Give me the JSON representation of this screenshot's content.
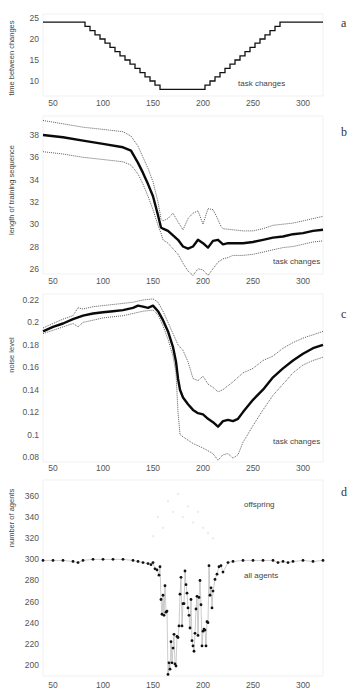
{
  "figure": {
    "panels": [
      {
        "id": "a",
        "label": "a",
        "ylabel": "time between changes",
        "annotation": "task changes"
      },
      {
        "id": "b",
        "label": "b",
        "ylabel": "length of training sequence",
        "annotation": "task changes"
      },
      {
        "id": "c",
        "label": "c",
        "ylabel": "noise level",
        "annotation": "task changes"
      },
      {
        "id": "d",
        "label": "d",
        "ylabel": "number of agents",
        "annotation_top": "offspring",
        "annotation_bottom": "all agents"
      }
    ]
  },
  "chart_data": [
    {
      "panel": "a",
      "type": "line",
      "title": "",
      "xlabel": "",
      "ylabel": "time between changes",
      "xlim": [
        40,
        320
      ],
      "ylim": [
        5,
        25
      ],
      "xticks": [
        50,
        100,
        150,
        200,
        250,
        300
      ],
      "yticks": [
        10,
        15,
        20,
        25
      ],
      "annotations": [
        "task changes"
      ],
      "series": [
        {
          "name": "time between changes",
          "style": "step-solid",
          "x": [
            40,
            80,
            82,
            85,
            87,
            90,
            92,
            95,
            97,
            100,
            102,
            105,
            107,
            110,
            112,
            115,
            117,
            120,
            122,
            125,
            127,
            130,
            132,
            135,
            137,
            140,
            142,
            145,
            147,
            150,
            152,
            155,
            157,
            200,
            202,
            205,
            207,
            210,
            212,
            215,
            217,
            220,
            222,
            225,
            227,
            230,
            232,
            235,
            237,
            240,
            242,
            245,
            247,
            250,
            252,
            255,
            257,
            260,
            262,
            265,
            267,
            270,
            272,
            275,
            277,
            320
          ],
          "y": [
            24,
            24,
            23,
            23,
            22,
            22,
            21,
            21,
            20,
            20,
            19,
            19,
            18,
            18,
            17,
            17,
            16,
            16,
            15,
            15,
            14,
            14,
            13,
            13,
            12,
            12,
            11,
            11,
            10,
            10,
            9,
            9,
            8,
            8,
            9,
            9,
            10,
            10,
            11,
            11,
            12,
            12,
            13,
            13,
            14,
            14,
            15,
            15,
            16,
            16,
            17,
            17,
            18,
            18,
            19,
            19,
            20,
            20,
            21,
            21,
            22,
            22,
            23,
            23,
            24,
            24
          ]
        }
      ]
    },
    {
      "panel": "b",
      "type": "line",
      "ylabel": "length of training sequence",
      "xlim": [
        40,
        320
      ],
      "ylim": [
        25,
        39.5
      ],
      "xticks": [
        50,
        100,
        150,
        200,
        250,
        300
      ],
      "yticks": [
        26,
        28,
        30,
        32,
        34,
        36,
        38
      ],
      "annotations": [
        "task changes"
      ],
      "series": [
        {
          "name": "mean",
          "style": "thick-solid",
          "x": [
            40,
            60,
            80,
            100,
            120,
            128,
            135,
            140,
            145,
            150,
            155,
            158,
            160,
            165,
            170,
            175,
            180,
            185,
            190,
            195,
            200,
            205,
            210,
            215,
            220,
            225,
            230,
            240,
            250,
            260,
            270,
            280,
            290,
            300,
            310,
            320
          ],
          "y": [
            38.0,
            37.8,
            37.5,
            37.2,
            36.9,
            36.6,
            35.5,
            34.6,
            33.6,
            32.5,
            30.8,
            29.7,
            29.6,
            29.4,
            29.0,
            28.6,
            28.0,
            27.8,
            28.0,
            28.6,
            28.3,
            27.9,
            28.5,
            28.6,
            28.2,
            28.3,
            28.3,
            28.3,
            28.4,
            28.6,
            28.8,
            28.9,
            29.1,
            29.2,
            29.4,
            29.5
          ]
        },
        {
          "name": "upper bound",
          "style": "dotted",
          "x": [
            40,
            60,
            80,
            100,
            120,
            128,
            135,
            140,
            145,
            150,
            155,
            158,
            160,
            165,
            170,
            175,
            180,
            185,
            190,
            195,
            200,
            205,
            210,
            213,
            218,
            220,
            230,
            240,
            250,
            260,
            270,
            280,
            290,
            300,
            310,
            320
          ],
          "y": [
            39.3,
            39.0,
            38.7,
            38.5,
            38.3,
            37.9,
            37.0,
            36.0,
            35.0,
            33.8,
            32.0,
            30.5,
            30.3,
            30.5,
            31.0,
            30.2,
            29.5,
            30.5,
            31.0,
            31.2,
            30.0,
            31.4,
            31.3,
            30.8,
            29.8,
            29.6,
            29.5,
            29.4,
            29.4,
            29.6,
            29.9,
            30.0,
            30.1,
            30.3,
            30.5,
            30.7
          ]
        },
        {
          "name": "lower bound",
          "style": "dotted",
          "x": [
            40,
            60,
            80,
            100,
            120,
            128,
            135,
            140,
            145,
            150,
            155,
            158,
            160,
            165,
            170,
            175,
            180,
            185,
            190,
            195,
            200,
            205,
            210,
            215,
            220,
            225,
            230,
            240,
            250,
            260,
            270,
            280,
            290,
            300,
            310,
            320
          ],
          "y": [
            36.5,
            36.3,
            36.0,
            35.8,
            35.6,
            35.3,
            34.5,
            33.6,
            32.5,
            31.3,
            29.9,
            29.2,
            28.6,
            28.3,
            27.8,
            27.3,
            26.5,
            25.8,
            25.4,
            26.0,
            25.9,
            25.4,
            26.0,
            26.6,
            26.9,
            27.0,
            27.2,
            27.2,
            27.3,
            27.5,
            27.7,
            27.9,
            28.0,
            28.2,
            28.4,
            28.5
          ]
        }
      ]
    },
    {
      "panel": "c",
      "type": "line",
      "ylabel": "noise level",
      "xlim": [
        40,
        320
      ],
      "ylim": [
        0.075,
        0.225
      ],
      "xticks": [
        50,
        100,
        150,
        200,
        250,
        300
      ],
      "yticks": [
        0.08,
        0.1,
        0.12,
        0.14,
        0.16,
        0.18,
        0.2,
        0.22
      ],
      "annotations": [
        "task changes"
      ],
      "series": [
        {
          "name": "mean",
          "style": "thick-solid",
          "x": [
            40,
            50,
            60,
            70,
            80,
            90,
            100,
            110,
            120,
            130,
            135,
            140,
            145,
            150,
            155,
            160,
            165,
            170,
            173,
            175,
            177,
            180,
            185,
            190,
            195,
            200,
            205,
            210,
            215,
            220,
            225,
            230,
            235,
            240,
            250,
            260,
            270,
            280,
            290,
            300,
            310,
            320
          ],
          "y": [
            0.192,
            0.196,
            0.199,
            0.203,
            0.206,
            0.208,
            0.209,
            0.21,
            0.211,
            0.213,
            0.215,
            0.214,
            0.213,
            0.215,
            0.21,
            0.202,
            0.192,
            0.178,
            0.165,
            0.15,
            0.14,
            0.133,
            0.127,
            0.122,
            0.119,
            0.118,
            0.114,
            0.111,
            0.107,
            0.112,
            0.113,
            0.112,
            0.114,
            0.12,
            0.131,
            0.14,
            0.151,
            0.159,
            0.166,
            0.172,
            0.177,
            0.18
          ]
        },
        {
          "name": "upper bound",
          "style": "dotted",
          "x": [
            40,
            50,
            60,
            70,
            75,
            80,
            90,
            100,
            110,
            120,
            130,
            140,
            150,
            155,
            160,
            165,
            170,
            175,
            180,
            185,
            190,
            195,
            200,
            205,
            210,
            215,
            220,
            230,
            240,
            250,
            260,
            270,
            280,
            290,
            300,
            310,
            320
          ],
          "y": [
            0.195,
            0.199,
            0.203,
            0.206,
            0.213,
            0.212,
            0.214,
            0.215,
            0.216,
            0.217,
            0.218,
            0.22,
            0.221,
            0.218,
            0.21,
            0.2,
            0.19,
            0.18,
            0.175,
            0.165,
            0.15,
            0.148,
            0.152,
            0.145,
            0.142,
            0.138,
            0.14,
            0.147,
            0.155,
            0.159,
            0.166,
            0.17,
            0.177,
            0.182,
            0.186,
            0.189,
            0.192
          ]
        },
        {
          "name": "lower bound",
          "style": "dotted",
          "x": [
            40,
            50,
            60,
            70,
            75,
            80,
            90,
            100,
            110,
            120,
            130,
            140,
            150,
            155,
            160,
            165,
            170,
            173,
            175,
            177,
            180,
            190,
            200,
            210,
            215,
            220,
            225,
            230,
            235,
            240,
            250,
            260,
            270,
            280,
            290,
            300,
            310,
            320
          ],
          "y": [
            0.19,
            0.193,
            0.196,
            0.199,
            0.196,
            0.2,
            0.202,
            0.204,
            0.205,
            0.206,
            0.208,
            0.21,
            0.211,
            0.207,
            0.197,
            0.185,
            0.17,
            0.155,
            0.12,
            0.1,
            0.098,
            0.092,
            0.088,
            0.083,
            0.077,
            0.082,
            0.083,
            0.079,
            0.082,
            0.093,
            0.108,
            0.122,
            0.135,
            0.145,
            0.155,
            0.162,
            0.166,
            0.169
          ]
        }
      ]
    },
    {
      "panel": "d",
      "type": "scatter",
      "ylabel": "number of agents",
      "xlim": [
        40,
        320
      ],
      "ylim": [
        188,
        372
      ],
      "xticks": [
        50,
        100,
        150,
        200,
        250,
        300
      ],
      "yticks": [
        200,
        220,
        240,
        260,
        280,
        300,
        320,
        340,
        360
      ],
      "annotations": [
        "offspring",
        "all agents"
      ],
      "series": [
        {
          "name": "all agents",
          "style": "markers-line",
          "x": [
            40,
            50,
            60,
            70,
            75,
            80,
            90,
            100,
            110,
            120,
            130,
            135,
            140,
            145,
            148,
            150,
            152,
            154,
            156,
            157,
            158,
            159,
            160,
            161,
            162,
            163,
            164,
            165,
            166,
            167,
            168,
            169,
            170,
            171,
            172,
            173,
            174,
            175,
            176,
            177,
            178,
            179,
            180,
            181,
            182,
            183,
            184,
            185,
            186,
            187,
            188,
            189,
            190,
            191,
            192,
            193,
            194,
            195,
            196,
            197,
            198,
            199,
            200,
            201,
            202,
            203,
            204,
            205,
            206,
            207,
            208,
            209,
            210,
            212,
            214,
            216,
            218,
            220,
            225,
            230,
            240,
            250,
            260,
            270,
            275,
            280,
            285,
            290,
            300,
            310,
            320
          ],
          "y": [
            299,
            299,
            299,
            298,
            297,
            299,
            300,
            300,
            300,
            300,
            299,
            298,
            297,
            296,
            295,
            297,
            291,
            290,
            285,
            293,
            262,
            248,
            266,
            247,
            275,
            250,
            251,
            191,
            202,
            196,
            222,
            202,
            216,
            229,
            201,
            199,
            227,
            226,
            237,
            267,
            283,
            237,
            258,
            258,
            289,
            276,
            268,
            254,
            247,
            235,
            262,
            223,
            218,
            213,
            230,
            253,
            265,
            228,
            264,
            280,
            257,
            218,
            232,
            234,
            233,
            218,
            241,
            240,
            294,
            266,
            273,
            254,
            270,
            281,
            286,
            293,
            294,
            288,
            297,
            298,
            299,
            299,
            299,
            299,
            297,
            298,
            297,
            298,
            299,
            298,
            299
          ]
        },
        {
          "name": "offspring",
          "style": "faint-markers",
          "x": [
            150,
            155,
            160,
            165,
            170,
            175,
            180,
            185,
            190,
            195,
            200,
            205,
            210
          ],
          "y": [
            322,
            340,
            330,
            355,
            345,
            362,
            340,
            350,
            335,
            345,
            330,
            325,
            320
          ]
        }
      ]
    }
  ]
}
